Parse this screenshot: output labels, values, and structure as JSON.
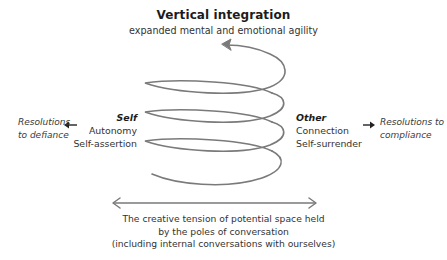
{
  "title": {
    "main": "Vertical integration",
    "sub": "expanded mental and emotional agility"
  },
  "poles": {
    "self": {
      "heading": "Self",
      "lines": [
        "Autonomy",
        "Self-assertion"
      ]
    },
    "other": {
      "heading": "Other",
      "lines": [
        "Connection",
        "Self-surrender"
      ]
    }
  },
  "resolutions": {
    "left": [
      "Resolutions",
      "to defiance"
    ],
    "right": [
      "Resolutions to",
      "compliance"
    ]
  },
  "caption": [
    "The creative tension of potential space held",
    "by the poles of conversation",
    "(including internal conversations with ourselves)"
  ],
  "icons": {
    "spiral": "upward-spiral-arrow-icon",
    "double_arrow": "double-headed-horizontal-arrow-icon",
    "left_arrow": "left-arrow-icon",
    "right_arrow": "right-arrow-icon"
  },
  "colors": {
    "stroke": "#7a7a7a",
    "text": "#333333",
    "heading": "#1c1c1c",
    "background": "#ffffff"
  }
}
